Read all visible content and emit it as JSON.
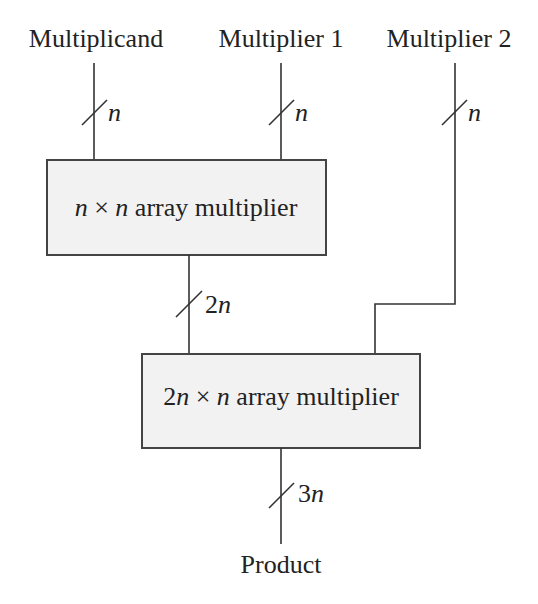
{
  "diagram": {
    "inputs": [
      {
        "label": "Multiplicand",
        "width_label": "n"
      },
      {
        "label": "Multiplier 1",
        "width_label": "n"
      },
      {
        "label": "Multiplier 2",
        "width_label": "n"
      }
    ],
    "blocks": [
      {
        "prefix": "n",
        "times": "×",
        "operand": "n",
        "rest": "array multiplier"
      },
      {
        "prefix_num": "2",
        "prefix": "n",
        "times": "×",
        "operand": "n",
        "rest": "array multiplier"
      }
    ],
    "intermediate": {
      "num": "2",
      "var": "n"
    },
    "output": {
      "label": "Product",
      "num": "3",
      "var": "n"
    },
    "colors": {
      "line": "#333333",
      "box_fill": "#f2f2f2",
      "box_border": "#444444",
      "text": "#222222"
    }
  }
}
